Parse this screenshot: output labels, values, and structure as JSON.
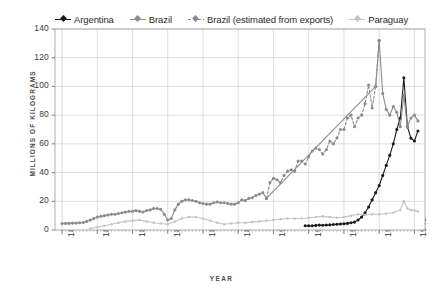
{
  "chart_data": {
    "type": "line",
    "title": "",
    "xlabel": "YEAR",
    "ylabel": "MILLIONS OF KILOGRAMS",
    "xlim": [
      1838,
      1943
    ],
    "ylim": [
      0,
      140
    ],
    "yticks": [
      0,
      20,
      40,
      60,
      80,
      100,
      120,
      140
    ],
    "xticks": [
      1840,
      1850,
      1860,
      1870,
      1880,
      1890,
      1900,
      1910,
      1920,
      1930,
      1940
    ],
    "grid": true,
    "legend_position": "top",
    "colors": {
      "argentina": "#1a1a1a",
      "brazil": "#8c8c8c",
      "brazil_estimated": "#8c8c8c",
      "paraguay": "#c4c4c4",
      "grid": "#d0d0d0",
      "axis": "#9a9a9a",
      "text": "#3a3a3a"
    },
    "series": [
      {
        "name": "Argentina",
        "style": "solid",
        "color": "#1a1a1a",
        "x": [
          1909,
          1910,
          1911,
          1912,
          1913,
          1914,
          1915,
          1916,
          1917,
          1918,
          1919,
          1920,
          1921,
          1922,
          1923,
          1924,
          1925,
          1926,
          1927,
          1928,
          1929,
          1930,
          1931,
          1932,
          1933,
          1934,
          1935,
          1936,
          1937,
          1938,
          1939,
          1940,
          1941
        ],
        "values": [
          3,
          3,
          3,
          3.2,
          3.4,
          3.3,
          3.5,
          3.6,
          3.8,
          4,
          4.2,
          4.4,
          4.6,
          5,
          5.5,
          7,
          9,
          12,
          16,
          21,
          26,
          31,
          38,
          45,
          52,
          60,
          70,
          78,
          106,
          72,
          64,
          62,
          69
        ]
      },
      {
        "name": "Brazil",
        "style": "solid",
        "color": "#8c8c8c",
        "x": [
          1840,
          1841,
          1842,
          1843,
          1844,
          1845,
          1846,
          1847,
          1848,
          1849,
          1850,
          1851,
          1852,
          1853,
          1854,
          1855,
          1856,
          1857,
          1858,
          1859,
          1860,
          1861,
          1862,
          1863,
          1864,
          1865,
          1866,
          1867,
          1868,
          1869,
          1870,
          1871,
          1872,
          1873,
          1874,
          1875,
          1876,
          1877,
          1878,
          1879,
          1880,
          1881,
          1882,
          1883,
          1884,
          1885,
          1886,
          1887,
          1888,
          1889,
          1890,
          1891,
          1892,
          1893,
          1894,
          1895,
          1896,
          1897,
          1898,
          1929,
          1930,
          1931,
          1932,
          1933,
          1934,
          1935,
          1936,
          1937,
          1938,
          1939,
          1940,
          1941
        ],
        "values": [
          4.5,
          4.6,
          4.6,
          4.8,
          4.8,
          5,
          5.2,
          6,
          7,
          8,
          9,
          9.5,
          10,
          10.5,
          11,
          11,
          11.5,
          12,
          12.5,
          13,
          13,
          13.5,
          13,
          12.5,
          13.5,
          14,
          15,
          15,
          14.5,
          11,
          7,
          8,
          14,
          18,
          20,
          21,
          21,
          20.5,
          20,
          19,
          18.5,
          18,
          18,
          19,
          19.5,
          19,
          19,
          18.5,
          18,
          18,
          19,
          21,
          20.5,
          22,
          22.5,
          24,
          25,
          26,
          22,
          100,
          132,
          95,
          84,
          80,
          86,
          82,
          72,
          94,
          72,
          78,
          80,
          76
        ]
      },
      {
        "name": "Brazil (estimated from exports)",
        "style": "dashed",
        "color": "#8c8c8c",
        "x": [
          1898,
          1899,
          1900,
          1901,
          1902,
          1903,
          1904,
          1905,
          1906,
          1907,
          1908,
          1909,
          1910,
          1911,
          1912,
          1913,
          1914,
          1915,
          1916,
          1917,
          1918,
          1919,
          1920,
          1921,
          1922,
          1923,
          1924,
          1925,
          1926,
          1927,
          1928,
          1929,
          1930
        ],
        "values": [
          22,
          33,
          36,
          35,
          33,
          38,
          41,
          42,
          41,
          48,
          48,
          46,
          51,
          55,
          57,
          56,
          53,
          56,
          62,
          60,
          64,
          70,
          70,
          78,
          80,
          72,
          78,
          80,
          88,
          101,
          85,
          100,
          132
        ]
      },
      {
        "name": "Paraguay",
        "style": "solid",
        "color": "#c4c4c4",
        "x": [
          1848,
          1850,
          1852,
          1854,
          1856,
          1858,
          1860,
          1862,
          1864,
          1866,
          1868,
          1870,
          1872,
          1874,
          1876,
          1878,
          1880,
          1882,
          1884,
          1886,
          1888,
          1890,
          1892,
          1894,
          1896,
          1898,
          1900,
          1902,
          1904,
          1906,
          1908,
          1910,
          1912,
          1914,
          1916,
          1918,
          1920,
          1922,
          1924,
          1926,
          1928,
          1930,
          1932,
          1934,
          1936,
          1937,
          1938,
          1939,
          1940,
          1941
        ],
        "values": [
          1,
          2,
          3,
          4,
          5,
          6,
          6.5,
          7,
          6,
          5,
          4.5,
          4,
          6,
          8,
          9,
          9,
          8,
          6.5,
          5,
          4,
          4.5,
          5,
          5,
          5.5,
          6,
          6.5,
          7,
          7.5,
          8,
          8,
          8,
          8.5,
          9,
          9.5,
          9,
          8.5,
          9,
          10,
          11,
          10.5,
          11,
          11,
          11.5,
          12,
          14,
          20,
          15,
          14,
          13.5,
          13
        ]
      }
    ]
  },
  "legend": {
    "items": [
      {
        "label": "Argentina",
        "key": "argentina"
      },
      {
        "label": "Brazil",
        "key": "brazil"
      },
      {
        "label": "Brazil (estimated from exports)",
        "key": "brazil_estimated"
      },
      {
        "label": "Paraguay",
        "key": "paraguay"
      }
    ]
  }
}
